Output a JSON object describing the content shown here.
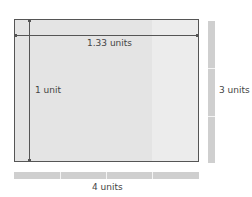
{
  "diagram": {
    "width_label": "1.33 units",
    "height_label": "1 unit",
    "right_bar_label": "3 units",
    "bottom_bar_label": "4 units",
    "colors": {
      "box_fill": "#e4e4e4",
      "highlight_fill": "#ececec",
      "bar_fill": "#cfcfcf",
      "line": "#555555"
    }
  }
}
